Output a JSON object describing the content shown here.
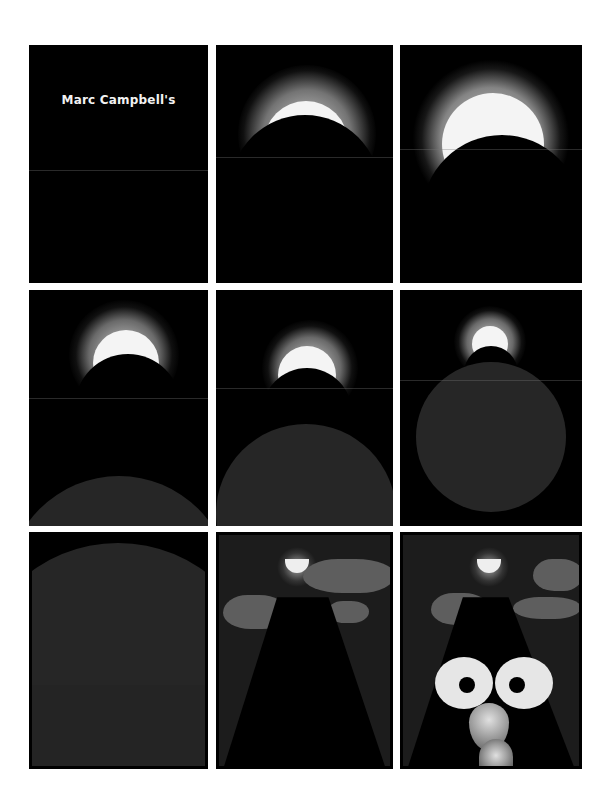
{
  "comic": {
    "title_text": "Marc Campbell's",
    "layout": {
      "rows": 3,
      "columns": 3,
      "panel_count": 9
    },
    "colors": {
      "page_background": "#ffffff",
      "panel_background": "#000000",
      "sun": "#f4f4f4",
      "planet_ring": "#5a5a5a",
      "cloud": "#5e5e5e",
      "eye_white": "#e6e6e6"
    },
    "panels": [
      {
        "index": 1,
        "content": "title-card"
      },
      {
        "index": 2,
        "content": "eclipse-crescent-rising"
      },
      {
        "index": 3,
        "content": "eclipse-large-sun"
      },
      {
        "index": 4,
        "content": "eclipse-with-planet-horizon"
      },
      {
        "index": 5,
        "content": "eclipse-with-planet-rising"
      },
      {
        "index": 6,
        "content": "eclipse-with-planet-circle"
      },
      {
        "index": 7,
        "content": "planet-surface-closeup"
      },
      {
        "index": 8,
        "content": "mountain-road-with-moon-and-clouds"
      },
      {
        "index": 9,
        "content": "mountain-face-with-eyes"
      }
    ]
  }
}
